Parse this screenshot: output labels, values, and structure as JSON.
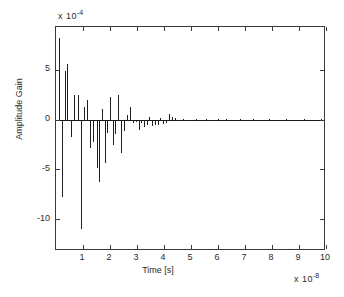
{
  "chart_data": {
    "type": "bar",
    "title": "",
    "subtitle": "",
    "xlabel": "Time [s]",
    "ylabel": "Amplitude Gain",
    "x_exponent_text": "x 10",
    "x_exponent_value": "-8",
    "y_exponent_text": "x 10",
    "y_exponent_value": "-4",
    "x_multiplier": 1e-08,
    "y_multiplier": 0.0001,
    "xlim": [
      0,
      10
    ],
    "ylim": [
      -13.2,
      9.3
    ],
    "xticks": [
      1,
      2,
      3,
      4,
      5,
      6,
      7,
      8,
      9,
      10
    ],
    "xtick_labels": [
      "1",
      "2",
      "3",
      "4",
      "5",
      "6",
      "7",
      "8",
      "9",
      "10"
    ],
    "yticks": [
      5,
      0,
      -5,
      -10
    ],
    "ytick_labels": [
      "5",
      "0",
      "-5",
      "-10"
    ],
    "grid": false,
    "legend": null,
    "annotations": [],
    "series_name": "impulse response",
    "x": [
      0.12,
      0.22,
      0.32,
      0.42,
      0.55,
      0.68,
      0.8,
      0.92,
      1.02,
      1.14,
      1.26,
      1.38,
      1.5,
      1.6,
      1.7,
      1.8,
      1.9,
      2.0,
      2.1,
      2.2,
      2.3,
      2.4,
      2.52,
      2.62,
      2.74,
      2.84,
      2.96,
      3.06,
      3.16,
      3.26,
      3.36,
      3.46,
      3.56,
      3.66,
      3.76,
      3.86,
      3.96,
      4.06,
      4.18,
      4.3,
      4.42,
      4.54,
      4.7,
      4.9,
      5.2,
      5.55,
      5.8,
      6.0,
      6.3,
      6.8,
      7.3,
      7.9,
      8.5,
      9.2,
      9.8
    ],
    "values": [
      8.2,
      -7.8,
      4.9,
      5.6,
      -1.8,
      2.5,
      2.45,
      -11.0,
      1.3,
      2.0,
      -2.9,
      -2.3,
      -4.9,
      -6.3,
      1.1,
      -4.4,
      -1.3,
      2.3,
      -2.6,
      -1.4,
      2.5,
      -3.4,
      -1.1,
      0.45,
      1.25,
      -0.35,
      -0.2,
      -1.0,
      -0.35,
      -0.7,
      -0.5,
      0.22,
      -0.6,
      -0.5,
      -0.55,
      0.2,
      -0.45,
      -0.3,
      0.55,
      0.3,
      0.18,
      -0.12,
      0.1,
      -0.08,
      0.06,
      0.05,
      -0.05,
      0.04,
      0.03,
      0.03,
      0.02,
      0.02,
      0.02,
      0.01,
      0.01
    ]
  },
  "axes": {
    "frame_color": "#3a3a3a",
    "stem_color": "#1f1f1f",
    "background": "#ffffff"
  }
}
